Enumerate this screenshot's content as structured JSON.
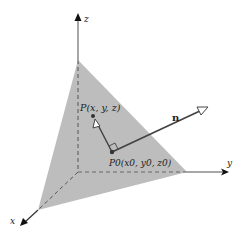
{
  "diagram": {
    "axes": {
      "x_label": "x",
      "y_label": "y",
      "z_label": "z"
    },
    "points": {
      "p_label": "P(x, y, z)",
      "p0_label_main": "P",
      "p0_label_sub": "0",
      "p0_label_rest": "(x",
      "p0_coords": "P0(x0, y0, z0)"
    },
    "vector": {
      "normal_label": "n"
    },
    "colors": {
      "plane": "#bdbdbd",
      "axis": "#8a8a8a",
      "line": "#444444"
    }
  }
}
